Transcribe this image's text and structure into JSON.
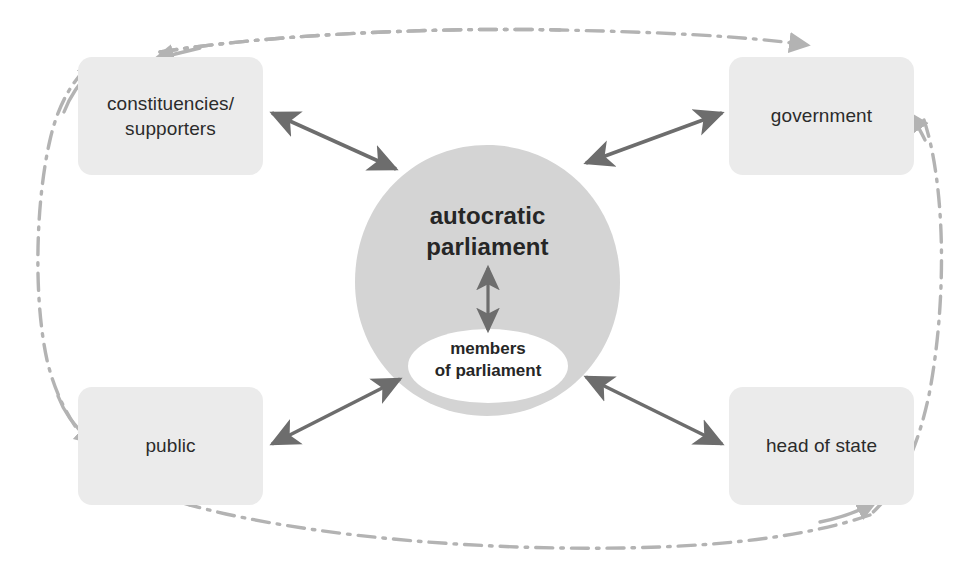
{
  "diagram": {
    "colors": {
      "box_fill": "#ebebeb",
      "ellipse_fill": "#d4d4d4",
      "inner_ellipse_fill": "#ffffff",
      "arrow": "#6d6d6d",
      "loop_line": "#b3b3b3",
      "text": "#262626"
    },
    "center": {
      "label_line1": "autocratic",
      "label_line2": "parliament",
      "inner_line1": "members",
      "inner_line2": "of parliament"
    },
    "nodes": [
      {
        "id": "constituencies",
        "line1": "constituencies/",
        "line2": "supporters"
      },
      {
        "id": "government",
        "line1": "government",
        "line2": ""
      },
      {
        "id": "public",
        "line1": "public",
        "line2": ""
      },
      {
        "id": "head_of_state",
        "line1": "head of state",
        "line2": ""
      }
    ]
  }
}
